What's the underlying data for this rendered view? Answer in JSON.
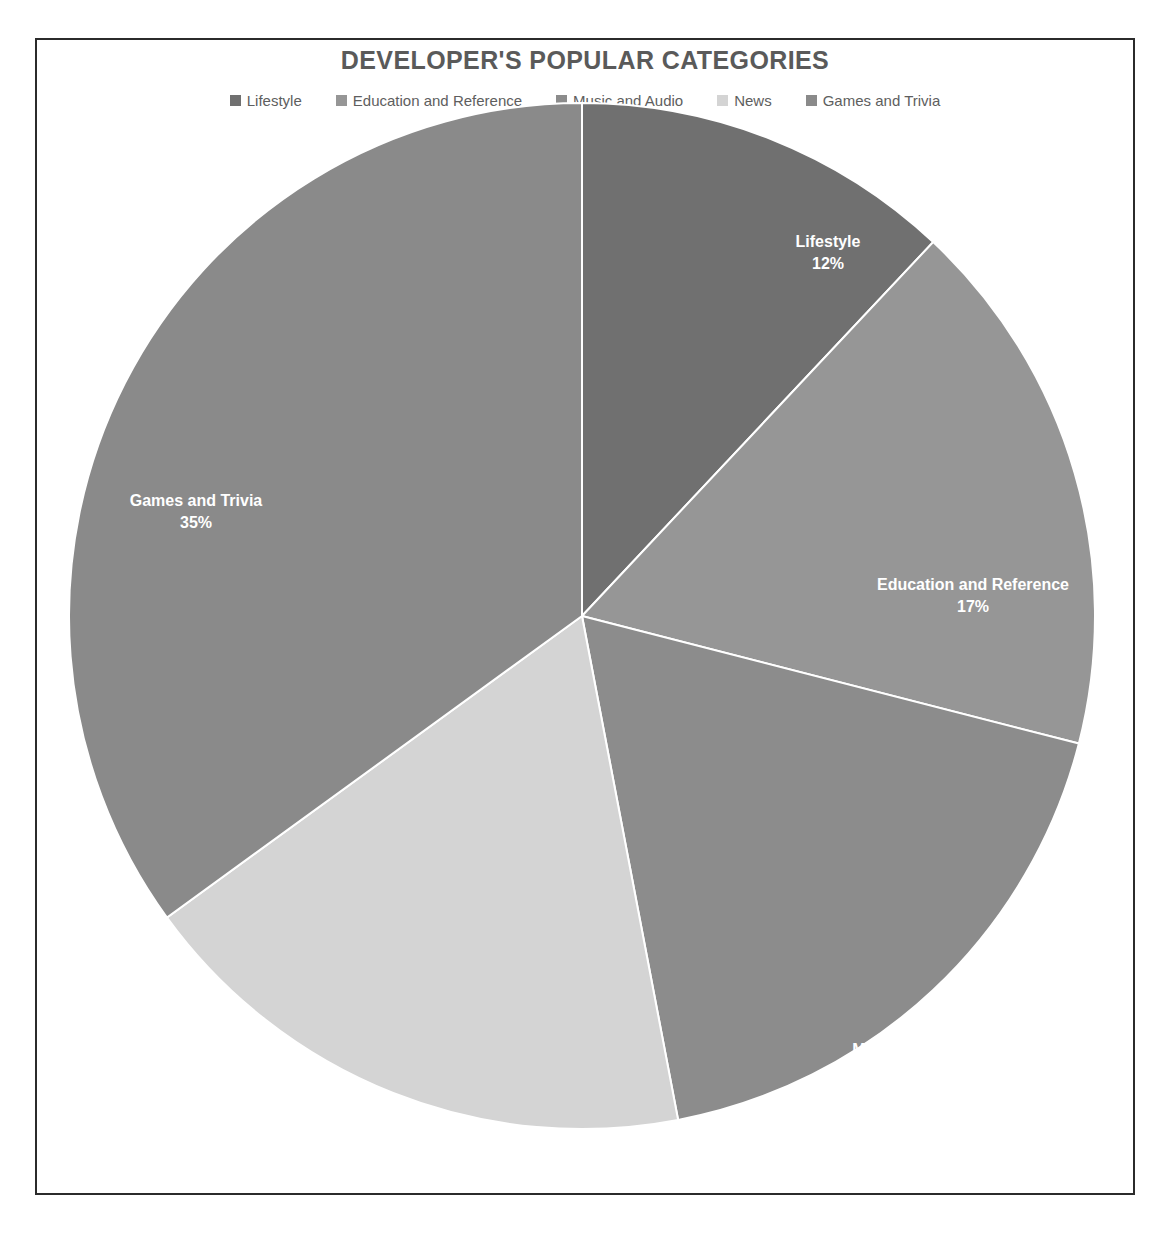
{
  "chart_data": {
    "type": "pie",
    "title": "DEVELOPER'S POPULAR CATEGORIES",
    "categories": [
      "Lifestyle",
      "Education and Reference",
      "Music and Audio",
      "News",
      "Games and Trivia"
    ],
    "values": [
      12,
      17,
      18,
      18,
      35
    ],
    "value_labels": [
      "12%",
      "17%",
      "18%",
      "18%",
      "35%"
    ],
    "colors": [
      "#707070",
      "#969696",
      "#8c8c8c",
      "#d4d4d4",
      "#8a8a8a"
    ],
    "legend_position": "top",
    "grid": false,
    "xlabel": "",
    "ylabel": "",
    "start_angle_deg": 0,
    "direction": "clockwise",
    "units": "percent",
    "total": 100
  },
  "legend": {
    "items": [
      {
        "label": "Lifestyle",
        "color": "#707070"
      },
      {
        "label": "Education and Reference",
        "color": "#969696"
      },
      {
        "label": "Music and Audio",
        "color": "#8c8c8c"
      },
      {
        "label": "News",
        "color": "#d4d4d4"
      },
      {
        "label": "Games and Trivia",
        "color": "#8a8a8a"
      }
    ]
  },
  "slices": [
    {
      "name": "Lifestyle",
      "percent_label": "12%",
      "label_x": 760,
      "label_y": 145,
      "color": "#707070"
    },
    {
      "name": "Education and Reference",
      "percent_label": "17%",
      "label_x": 905,
      "label_y": 488,
      "color": "#969696"
    },
    {
      "name": "Music and Audio",
      "percent_label": "18%",
      "label_x": 848,
      "label_y": 953,
      "color": "#8c8c8c"
    },
    {
      "name": "News",
      "percent_label": "18%",
      "label_x": 387,
      "label_y": 1035,
      "color": "#d4d4d4"
    },
    {
      "name": "Games and Trivia",
      "percent_label": "35%",
      "label_x": 128,
      "label_y": 404,
      "color": "#8a8a8a"
    }
  ],
  "frame": {
    "border_color": "#2b2b2b",
    "background": "#ffffff"
  },
  "title_color": "#5a5a5a"
}
